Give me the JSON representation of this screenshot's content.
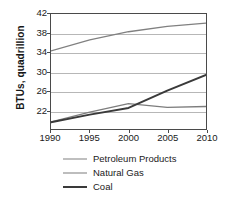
{
  "chart_data": {
    "type": "line",
    "title": "",
    "xlabel": "",
    "ylabel": "BTUs, quadrillion",
    "xlim": [
      1990,
      2010
    ],
    "ylim": [
      18,
      42
    ],
    "grid": true,
    "legend_position": "bottom",
    "xticks": [
      1990,
      1995,
      2000,
      2005,
      2010
    ],
    "yticks": [
      22,
      26,
      30,
      34,
      38,
      42
    ],
    "x": [
      1990,
      1995,
      2000,
      2005,
      2010
    ],
    "series": [
      {
        "name": "Petroleum Products",
        "color": "#808080",
        "width": 1.3,
        "values": [
          34.3,
          36.6,
          38.3,
          39.4,
          40.1
        ]
      },
      {
        "name": "Natural Gas",
        "color": "#7d7d7d",
        "width": 1.3,
        "values": [
          19.5,
          21.5,
          23.3,
          22.5,
          22.7
        ]
      },
      {
        "name": "Coal",
        "color": "#3a3a3a",
        "width": 2.0,
        "values": [
          19.4,
          21.0,
          22.4,
          26.0,
          29.3
        ]
      }
    ]
  },
  "axis": {
    "y_title": "BTUs, quadrillion",
    "y_tick_labels": [
      "42",
      "38",
      "34",
      "30",
      "26",
      "22"
    ],
    "x_tick_labels": [
      "1990",
      "1995",
      "2000",
      "2005",
      "2010"
    ]
  },
  "legend": {
    "items": [
      {
        "label": "Petroleum Products"
      },
      {
        "label": "Natural Gas"
      },
      {
        "label": "Coal"
      }
    ]
  },
  "colors": {
    "frame": "#4a4a4a",
    "gridline": "#b7b7b7",
    "text": "#1a1a1a",
    "background": "#ffffff"
  }
}
